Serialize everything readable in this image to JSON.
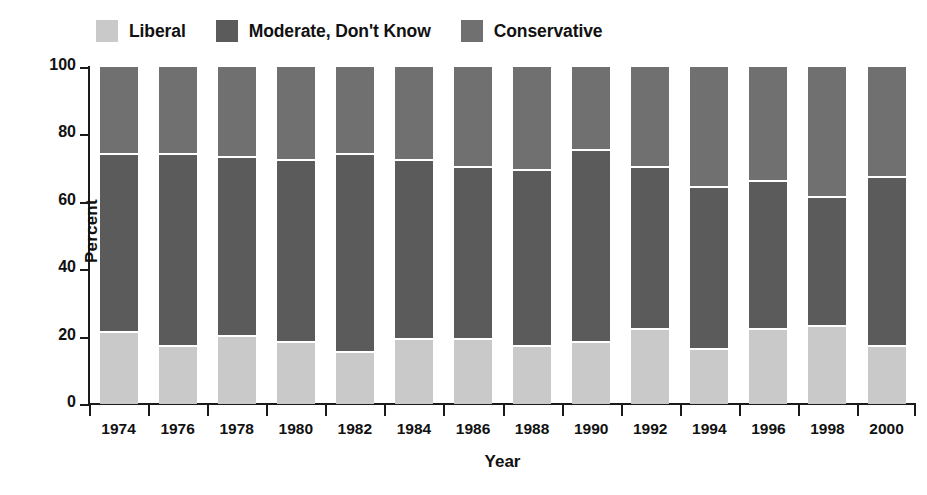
{
  "legend": {
    "position": "top-left",
    "items": [
      {
        "label": "Liberal",
        "color": "#c9c9c9",
        "key": "liberal"
      },
      {
        "label": "Moderate, Don't Know",
        "color": "#5b5b5b",
        "key": "moderate"
      },
      {
        "label": "Conservative",
        "color": "#707070",
        "key": "conservative"
      }
    ]
  },
  "axes": {
    "y": {
      "label": "Percent",
      "ticks": [
        0,
        20,
        40,
        60,
        80,
        100
      ],
      "min": 0,
      "max": 100
    },
    "x": {
      "label": "Year"
    }
  },
  "chart_data": {
    "type": "bar",
    "stacked": true,
    "orientation": "vertical",
    "title": "",
    "subtitle": "",
    "xlabel": "Year",
    "ylabel": "Percent",
    "ylim": [
      0,
      100
    ],
    "yticks": [
      0,
      20,
      40,
      60,
      80,
      100
    ],
    "grid": false,
    "legend_position": "top-left",
    "categories": [
      "1974",
      "1976",
      "1978",
      "1980",
      "1982",
      "1984",
      "1986",
      "1988",
      "1990",
      "1992",
      "1994",
      "1996",
      "1998",
      "2000"
    ],
    "series": [
      {
        "name": "Liberal",
        "color": "#c9c9c9",
        "values": [
          21,
          17,
          20,
          18,
          15,
          19,
          19,
          17,
          18,
          22,
          16,
          22,
          23,
          17
        ]
      },
      {
        "name": "Moderate, Don't Know",
        "color": "#5b5b5b",
        "values": [
          53,
          57,
          53,
          54,
          59,
          53,
          51,
          52,
          57,
          48,
          48,
          44,
          38,
          50
        ]
      },
      {
        "name": "Conservative",
        "color": "#707070",
        "values": [
          26,
          26,
          27,
          28,
          26,
          28,
          30,
          31,
          25,
          30,
          36,
          34,
          39,
          33
        ]
      }
    ],
    "cumulative_boundaries": {
      "note": "top of Liberal, then top of Moderate (percent)",
      "liberal_top": [
        21,
        17,
        20,
        18,
        15,
        19,
        19,
        17,
        18,
        22,
        16,
        22,
        23,
        17
      ],
      "moderate_top": [
        74,
        74,
        73,
        72,
        74,
        72,
        70,
        69,
        75,
        70,
        64,
        66,
        61,
        67
      ]
    }
  }
}
